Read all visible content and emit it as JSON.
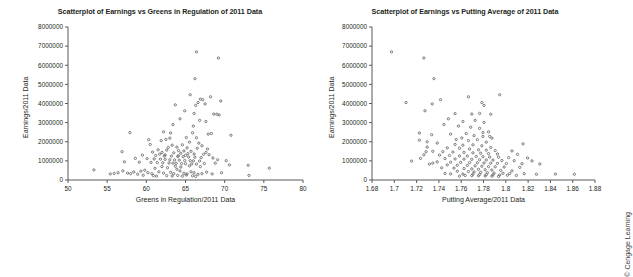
{
  "figure": {
    "background": "#ffffff",
    "credit": "© Cengage Learning",
    "point_color": "#6e6e6e",
    "axis_color": "#58595b"
  },
  "chart_data": [
    {
      "id": "greens-in-regulation",
      "type": "scatter",
      "title": "Scatterplot of Earnings vs Greens in Regulation of 2011 Data",
      "xlabel": "Greens in Regulation/2011 Data",
      "ylabel": "Earnings/2011 Data",
      "xlim": [
        50,
        80
      ],
      "ylim": [
        0,
        8000000
      ],
      "xticks": [
        50,
        55,
        60,
        65,
        70,
        75,
        80
      ],
      "xtick_labels": [
        "50",
        "55",
        "60",
        "65",
        "70",
        "75",
        "80"
      ],
      "yticks": [
        0,
        1000000,
        2000000,
        3000000,
        4000000,
        5000000,
        6000000,
        7000000,
        8000000
      ],
      "ytick_labels": [
        "0",
        "1000000",
        "2000000",
        "3000000",
        "4000000",
        "5000000",
        "6000000",
        "7000000",
        "8000000"
      ],
      "grid": false,
      "legend": "none",
      "marker": "circle",
      "points": [
        [
          66.4,
          6700000
        ],
        [
          69.2,
          6380000
        ],
        [
          66.2,
          5300000
        ],
        [
          65.6,
          4460000
        ],
        [
          68.2,
          4350000
        ],
        [
          69.5,
          4130000
        ],
        [
          66.6,
          4050000
        ],
        [
          66.9,
          4230000
        ],
        [
          67.2,
          4200000
        ],
        [
          63.7,
          3930000
        ],
        [
          66.3,
          3900000
        ],
        [
          67.5,
          3980000
        ],
        [
          64.9,
          3620000
        ],
        [
          66.1,
          3480000
        ],
        [
          68.6,
          3450000
        ],
        [
          69.0,
          3440000
        ],
        [
          69.3,
          3400000
        ],
        [
          64.3,
          3200000
        ],
        [
          66.8,
          3120000
        ],
        [
          67.6,
          3060000
        ],
        [
          63.4,
          2900000
        ],
        [
          66.0,
          2820000
        ],
        [
          62.2,
          2520000
        ],
        [
          57.9,
          2480000
        ],
        [
          63.1,
          2460000
        ],
        [
          65.9,
          2470000
        ],
        [
          67.9,
          2400000
        ],
        [
          68.3,
          2430000
        ],
        [
          70.8,
          2340000
        ],
        [
          63.0,
          2190000
        ],
        [
          65.1,
          2220000
        ],
        [
          66.4,
          2210000
        ],
        [
          60.3,
          2110000
        ],
        [
          61.9,
          2060000
        ],
        [
          62.5,
          2120000
        ],
        [
          65.5,
          1980000
        ],
        [
          66.7,
          1930000
        ],
        [
          60.5,
          1860000
        ],
        [
          63.3,
          1820000
        ],
        [
          64.6,
          1840000
        ],
        [
          67.1,
          1790000
        ],
        [
          62.8,
          1700000
        ],
        [
          63.9,
          1720000
        ],
        [
          65.2,
          1680000
        ],
        [
          66.5,
          1660000
        ],
        [
          67.8,
          1620000
        ],
        [
          61.5,
          1580000
        ],
        [
          62.6,
          1560000
        ],
        [
          64.1,
          1540000
        ],
        [
          64.8,
          1520000
        ],
        [
          65.7,
          1500000
        ],
        [
          56.9,
          1480000
        ],
        [
          60.8,
          1460000
        ],
        [
          62.0,
          1440000
        ],
        [
          63.5,
          1420000
        ],
        [
          64.4,
          1400000
        ],
        [
          65.3,
          1380000
        ],
        [
          66.1,
          1360000
        ],
        [
          67.3,
          1340000
        ],
        [
          68.0,
          1320000
        ],
        [
          59.5,
          1300000
        ],
        [
          61.2,
          1280000
        ],
        [
          62.3,
          1260000
        ],
        [
          63.2,
          1250000
        ],
        [
          64.0,
          1230000
        ],
        [
          64.7,
          1220000
        ],
        [
          65.4,
          1200000
        ],
        [
          66.2,
          1190000
        ],
        [
          67.0,
          1170000
        ],
        [
          68.5,
          1150000
        ],
        [
          58.6,
          1130000
        ],
        [
          60.1,
          1120000
        ],
        [
          61.0,
          1100000
        ],
        [
          61.8,
          1090000
        ],
        [
          62.4,
          1080000
        ],
        [
          63.0,
          1060000
        ],
        [
          63.6,
          1050000
        ],
        [
          64.2,
          1040000
        ],
        [
          64.9,
          1020000
        ],
        [
          65.6,
          1010000
        ],
        [
          66.0,
          1000000
        ],
        [
          66.8,
          990000
        ],
        [
          69.1,
          1060000
        ],
        [
          70.2,
          1010000
        ],
        [
          57.2,
          950000
        ],
        [
          59.1,
          930000
        ],
        [
          60.6,
          920000
        ],
        [
          61.4,
          910000
        ],
        [
          62.1,
          900000
        ],
        [
          62.9,
          890000
        ],
        [
          63.4,
          880000
        ],
        [
          63.8,
          870000
        ],
        [
          64.5,
          860000
        ],
        [
          65.0,
          850000
        ],
        [
          65.8,
          840000
        ],
        [
          66.4,
          830000
        ],
        [
          67.4,
          860000
        ],
        [
          68.8,
          880000
        ],
        [
          70.6,
          790000
        ],
        [
          73.0,
          770000
        ],
        [
          75.7,
          620000
        ],
        [
          53.3,
          530000
        ],
        [
          55.4,
          320000
        ],
        [
          55.9,
          340000
        ],
        [
          56.4,
          380000
        ],
        [
          57.0,
          480000
        ],
        [
          57.6,
          360000
        ],
        [
          58.0,
          330000
        ],
        [
          58.4,
          420000
        ],
        [
          58.9,
          300000
        ],
        [
          59.3,
          460000
        ],
        [
          59.8,
          510000
        ],
        [
          60.2,
          380000
        ],
        [
          60.7,
          330000
        ],
        [
          61.1,
          610000
        ],
        [
          61.6,
          430000
        ],
        [
          62.2,
          360000
        ],
        [
          62.7,
          640000
        ],
        [
          63.1,
          400000
        ],
        [
          63.5,
          330000
        ],
        [
          63.9,
          560000
        ],
        [
          64.3,
          470000
        ],
        [
          64.8,
          350000
        ],
        [
          65.2,
          320000
        ],
        [
          65.7,
          430000
        ],
        [
          66.1,
          380000
        ],
        [
          66.6,
          300000
        ],
        [
          67.1,
          330000
        ],
        [
          67.7,
          410000
        ],
        [
          68.4,
          320000
        ],
        [
          69.6,
          380000
        ],
        [
          62.6,
          230000
        ],
        [
          63.3,
          210000
        ],
        [
          64.0,
          240000
        ],
        [
          64.6,
          200000
        ],
        [
          65.1,
          260000
        ],
        [
          65.9,
          220000
        ],
        [
          66.3,
          190000
        ],
        [
          59.6,
          250000
        ],
        [
          60.9,
          230000
        ],
        [
          61.3,
          200000
        ],
        [
          73.1,
          240000
        ],
        [
          62.0,
          700000
        ],
        [
          63.7,
          720000
        ],
        [
          64.4,
          680000
        ],
        [
          65.5,
          740000
        ],
        [
          66.9,
          700000
        ],
        [
          61.7,
          1350000
        ],
        [
          62.4,
          1310000
        ],
        [
          64.1,
          1270000
        ],
        [
          65.0,
          1290000
        ],
        [
          67.6,
          1440000
        ]
      ]
    },
    {
      "id": "putting-average",
      "type": "scatter",
      "title": "Scatterplot of Earnings vs Putting Average of 2011 Data",
      "xlabel": "Putting Average/2011 Data",
      "ylabel": "Earnings/2011 Data",
      "xlim": [
        1.68,
        1.88
      ],
      "ylim": [
        0,
        8000000
      ],
      "xticks": [
        1.68,
        1.7,
        1.72,
        1.74,
        1.76,
        1.78,
        1.8,
        1.82,
        1.84,
        1.86,
        1.88
      ],
      "xtick_labels": [
        "1.68",
        "1.7",
        "1.72",
        "1.74",
        "1.76",
        "1.78",
        "1.8",
        "1.82",
        "1.84",
        "1.86",
        "1.88"
      ],
      "yticks": [
        0,
        1000000,
        2000000,
        3000000,
        4000000,
        5000000,
        6000000,
        7000000,
        8000000
      ],
      "ytick_labels": [
        "0",
        "1000000",
        "2000000",
        "3000000",
        "4000000",
        "5000000",
        "6000000",
        "7000000",
        "8000000"
      ],
      "grid": false,
      "legend": "none",
      "marker": "circle",
      "points": [
        [
          1.6975,
          6700000
        ],
        [
          1.7265,
          6380000
        ],
        [
          1.7355,
          5300000
        ],
        [
          1.7665,
          4350000
        ],
        [
          1.7945,
          4460000
        ],
        [
          1.7785,
          4050000
        ],
        [
          1.7805,
          3900000
        ],
        [
          1.7415,
          4200000
        ],
        [
          1.7105,
          4050000
        ],
        [
          1.734,
          3980000
        ],
        [
          1.7275,
          3620000
        ],
        [
          1.7545,
          3470000
        ],
        [
          1.7695,
          3450000
        ],
        [
          1.7765,
          3480000
        ],
        [
          1.7865,
          3440000
        ],
        [
          1.7485,
          3200000
        ],
        [
          1.7615,
          3060000
        ],
        [
          1.7725,
          3120000
        ],
        [
          1.7805,
          3010000
        ],
        [
          1.7445,
          2900000
        ],
        [
          1.7575,
          2820000
        ],
        [
          1.7685,
          2760000
        ],
        [
          1.7765,
          2700000
        ],
        [
          1.7845,
          2520000
        ],
        [
          1.7225,
          2460000
        ],
        [
          1.7335,
          2370000
        ],
        [
          1.7505,
          2400000
        ],
        [
          1.7645,
          2430000
        ],
        [
          1.7715,
          2320000
        ],
        [
          1.7795,
          2280000
        ],
        [
          1.7875,
          2190000
        ],
        [
          1.7225,
          2080000
        ],
        [
          1.7295,
          2000000
        ],
        [
          1.7555,
          2120000
        ],
        [
          1.7665,
          2060000
        ],
        [
          1.7745,
          2110000
        ],
        [
          1.7825,
          1980000
        ],
        [
          1.8155,
          1890000
        ],
        [
          1.7385,
          1930000
        ],
        [
          1.7545,
          1860000
        ],
        [
          1.7615,
          1820000
        ],
        [
          1.7705,
          1840000
        ],
        [
          1.7785,
          1790000
        ],
        [
          1.7865,
          1700000
        ],
        [
          1.7295,
          1720000
        ],
        [
          1.7475,
          1680000
        ],
        [
          1.7585,
          1660000
        ],
        [
          1.7675,
          1620000
        ],
        [
          1.7755,
          1580000
        ],
        [
          1.7825,
          1560000
        ],
        [
          1.7905,
          1540000
        ],
        [
          1.8055,
          1520000
        ],
        [
          1.7345,
          1500000
        ],
        [
          1.7435,
          1480000
        ],
        [
          1.7525,
          1460000
        ],
        [
          1.7625,
          1440000
        ],
        [
          1.7705,
          1420000
        ],
        [
          1.7775,
          1400000
        ],
        [
          1.7845,
          1380000
        ],
        [
          1.7925,
          1360000
        ],
        [
          1.8105,
          1340000
        ],
        [
          1.7265,
          1320000
        ],
        [
          1.7405,
          1300000
        ],
        [
          1.7495,
          1280000
        ],
        [
          1.7585,
          1260000
        ],
        [
          1.7655,
          1250000
        ],
        [
          1.7735,
          1230000
        ],
        [
          1.7795,
          1220000
        ],
        [
          1.7855,
          1200000
        ],
        [
          1.7935,
          1190000
        ],
        [
          1.8025,
          1170000
        ],
        [
          1.8195,
          1150000
        ],
        [
          1.7235,
          1130000
        ],
        [
          1.7455,
          1120000
        ],
        [
          1.7545,
          1100000
        ],
        [
          1.7625,
          1090000
        ],
        [
          1.7695,
          1080000
        ],
        [
          1.7765,
          1060000
        ],
        [
          1.7825,
          1050000
        ],
        [
          1.7885,
          1040000
        ],
        [
          1.7965,
          1020000
        ],
        [
          1.8075,
          1010000
        ],
        [
          1.8235,
          1000000
        ],
        [
          1.7155,
          990000
        ],
        [
          1.7385,
          950000
        ],
        [
          1.7505,
          930000
        ],
        [
          1.7595,
          920000
        ],
        [
          1.7675,
          910000
        ],
        [
          1.7745,
          900000
        ],
        [
          1.7805,
          890000
        ],
        [
          1.7865,
          880000
        ],
        [
          1.7925,
          870000
        ],
        [
          1.8005,
          860000
        ],
        [
          1.8145,
          850000
        ],
        [
          1.8305,
          840000
        ],
        [
          1.7315,
          830000
        ],
        [
          1.7475,
          790000
        ],
        [
          1.7565,
          770000
        ],
        [
          1.7655,
          760000
        ],
        [
          1.7725,
          740000
        ],
        [
          1.7785,
          720000
        ],
        [
          1.7845,
          700000
        ],
        [
          1.7905,
          690000
        ],
        [
          1.7985,
          680000
        ],
        [
          1.8125,
          660000
        ],
        [
          1.7425,
          640000
        ],
        [
          1.7535,
          620000
        ],
        [
          1.7625,
          600000
        ],
        [
          1.7695,
          580000
        ],
        [
          1.7755,
          560000
        ],
        [
          1.7815,
          540000
        ],
        [
          1.7875,
          520000
        ],
        [
          1.7955,
          500000
        ],
        [
          1.8055,
          480000
        ],
        [
          1.7565,
          460000
        ],
        [
          1.7665,
          440000
        ],
        [
          1.7715,
          420000
        ],
        [
          1.7775,
          400000
        ],
        [
          1.7835,
          380000
        ],
        [
          1.7895,
          360000
        ],
        [
          1.7975,
          350000
        ],
        [
          1.8035,
          340000
        ],
        [
          1.8165,
          330000
        ],
        [
          1.7505,
          320000
        ],
        [
          1.7615,
          310000
        ],
        [
          1.7705,
          300000
        ],
        [
          1.7765,
          290000
        ],
        [
          1.7825,
          280000
        ],
        [
          1.7885,
          270000
        ],
        [
          1.7945,
          260000
        ],
        [
          1.8015,
          250000
        ],
        [
          1.8095,
          240000
        ],
        [
          1.8275,
          300000
        ],
        [
          1.8445,
          310000
        ],
        [
          1.8615,
          300000
        ],
        [
          1.7695,
          230000
        ],
        [
          1.7755,
          220000
        ],
        [
          1.7815,
          210000
        ],
        [
          1.7875,
          200000
        ],
        [
          1.7935,
          190000
        ],
        [
          1.7635,
          240000
        ],
        [
          1.7585,
          200000
        ],
        [
          1.7455,
          340000
        ],
        [
          1.7345,
          880000
        ],
        [
          1.7285,
          1480000
        ],
        [
          1.7605,
          2200000
        ],
        [
          1.7855,
          2280000
        ],
        [
          1.7795,
          2480000
        ]
      ]
    }
  ]
}
